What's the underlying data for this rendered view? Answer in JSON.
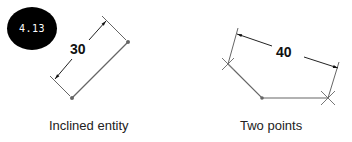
{
  "badge": {
    "label": "4.13"
  },
  "figures": [
    {
      "id": "inclined-entity",
      "caption": "Inclined entity",
      "dimension_value": "30"
    },
    {
      "id": "two-points",
      "caption": "Two points",
      "dimension_value": "40"
    }
  ],
  "colors": {
    "line": "#555555",
    "dim": "#333333",
    "badge_bg": "#000000",
    "badge_text": "#ffffff"
  }
}
